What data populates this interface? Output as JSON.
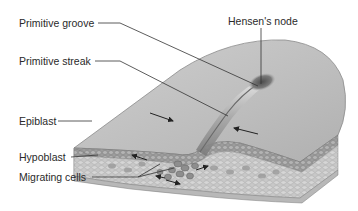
{
  "figure": {
    "labels": {
      "primitive_groove": "Primitive groove",
      "primitive_streak": "Primitive streak",
      "hensens_node": "Hensen's node",
      "epiblast": "Epiblast",
      "hypoblast": "Hypoblast",
      "migrating_cells": "Migrating cells"
    },
    "colors": {
      "surface": "#bdbdbd",
      "surface_light": "#d2d2d2",
      "edge": "#8a8a8a",
      "epiblast_layer": "#9a9a9a",
      "cell_dark": "#7c7c7c",
      "hypoblast_layer": "#c4c4c4",
      "node_dark": "#5a5a5a",
      "leader_line": "#333333"
    }
  }
}
